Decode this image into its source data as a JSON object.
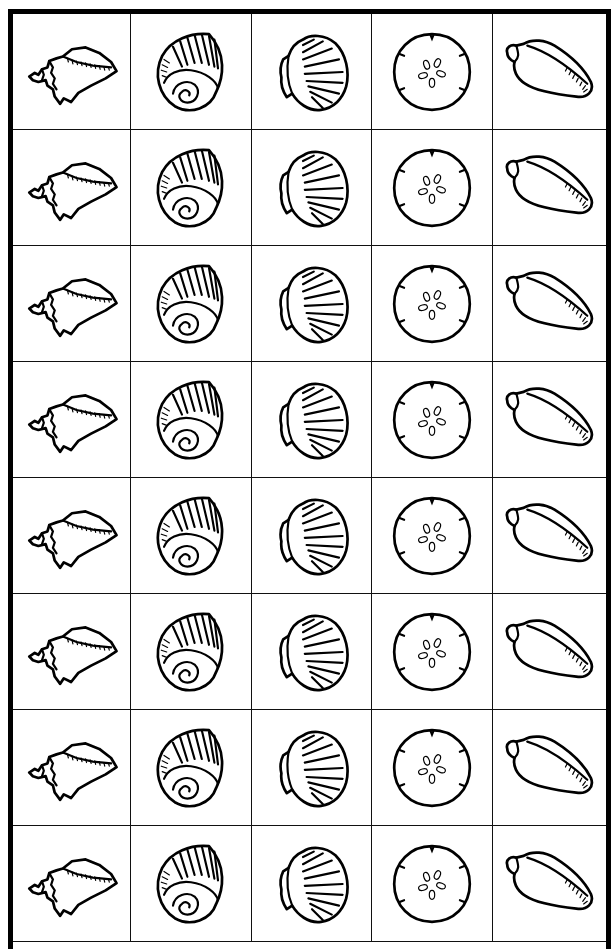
{
  "sheet": {
    "rows": 8,
    "columns": 5,
    "border_color": "#000000",
    "background": "#ffffff",
    "column_shells": [
      {
        "icon": "conch-shell-icon",
        "label": "Conch shell"
      },
      {
        "icon": "moon-snail-shell-icon",
        "label": "Moon snail shell"
      },
      {
        "icon": "scallop-shell-icon",
        "label": "Scallop shell"
      },
      {
        "icon": "sand-dollar-icon",
        "label": "Sand dollar"
      },
      {
        "icon": "cone-shell-icon",
        "label": "Cone shell"
      }
    ]
  }
}
